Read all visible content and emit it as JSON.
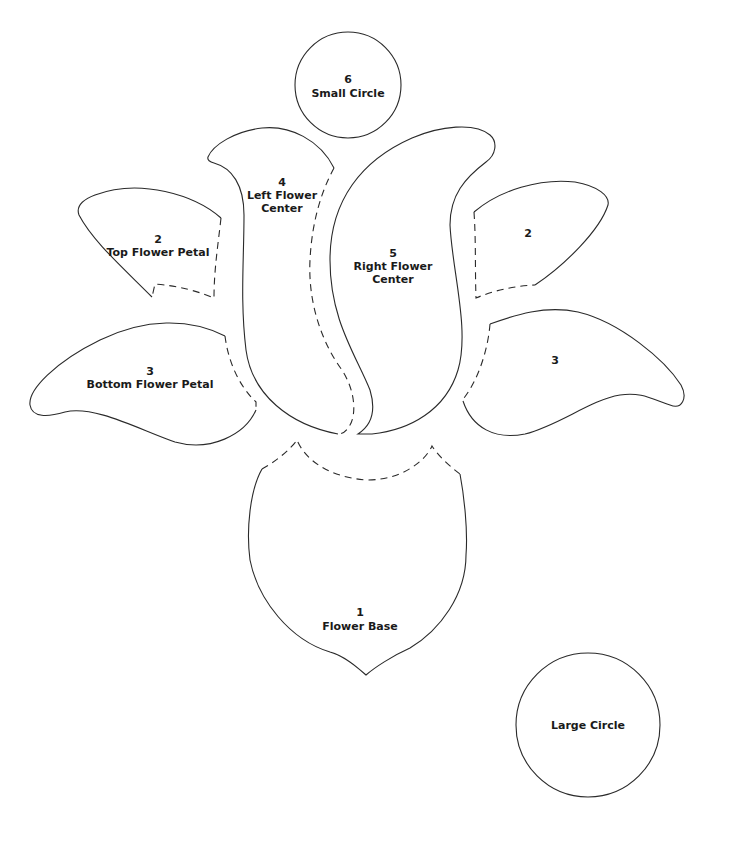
{
  "pieces": {
    "flower_base": {
      "number": "1",
      "name": "Flower Base"
    },
    "top_petal_left": {
      "number": "2",
      "name": "Top Flower Petal"
    },
    "top_petal_right": {
      "number": "2",
      "name": ""
    },
    "bottom_petal_left": {
      "number": "3",
      "name": "Bottom Flower Petal"
    },
    "bottom_petal_right": {
      "number": "3",
      "name": ""
    },
    "left_center": {
      "number": "4",
      "name_line1": "Left Flower",
      "name_line2": "Center"
    },
    "right_center": {
      "number": "5",
      "name_line1": "Right Flower",
      "name_line2": "Center"
    },
    "small_circle": {
      "number": "6",
      "name": "Small Circle"
    },
    "large_circle": {
      "number": "",
      "name": "Large Circle"
    }
  },
  "legend": {
    "solid_line": "cutting line",
    "dashed_line": "overlap / placement line"
  },
  "colors": {
    "line": "#2a2a2a",
    "text": "#1a1a1a",
    "background": "#ffffff"
  }
}
